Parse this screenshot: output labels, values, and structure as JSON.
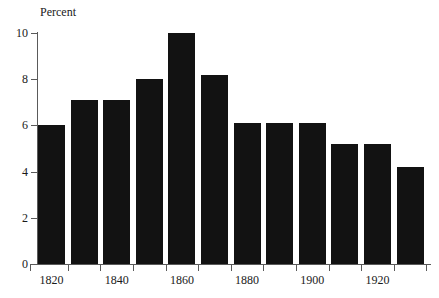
{
  "chart_data": {
    "type": "bar",
    "title": "",
    "xlabel": "",
    "ylabel": "Percent",
    "categories": [
      "1820",
      "1825",
      "1830",
      "1835",
      "1840",
      "1845",
      "1850",
      "1855",
      "1860",
      "1865",
      "1870",
      "1875"
    ],
    "bar_labels": [
      "1820",
      "",
      "1840",
      "",
      "1860",
      "",
      "1880",
      "",
      "1900",
      "",
      "1920",
      ""
    ],
    "values": [
      6.0,
      7.1,
      7.1,
      8.0,
      10.0,
      8.2,
      6.1,
      6.1,
      6.1,
      5.2,
      5.2,
      4.2
    ],
    "ylim": [
      0,
      10
    ],
    "ytick_labels": [
      "0",
      "2",
      "4",
      "6",
      "8",
      "10"
    ],
    "ytick_values": [
      0,
      2,
      4,
      6,
      8,
      10
    ],
    "xtick_labels": [
      "1820",
      "1840",
      "1860",
      "1880",
      "1900",
      "1920"
    ],
    "xtick_label_bar_index": [
      0,
      2,
      4,
      6,
      8,
      10
    ],
    "grid": false,
    "legend": false,
    "bar_color": "#121212",
    "axis_color": "#5a5a5a",
    "text_color": "#1a1a1a",
    "background_color": "#ffffff"
  }
}
